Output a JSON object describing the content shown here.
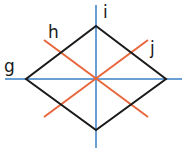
{
  "diagram": {
    "shape": "rhombus",
    "colors": {
      "axis": "#6a9fd4",
      "diagonal": "#e8663c",
      "outline": "#1a1a1a"
    },
    "lines": [
      {
        "label": "g",
        "type": "horizontal-axis"
      },
      {
        "label": "h",
        "type": "diagonal-descending"
      },
      {
        "label": "i",
        "type": "vertical-axis"
      },
      {
        "label": "j",
        "type": "diagonal-ascending"
      }
    ]
  }
}
